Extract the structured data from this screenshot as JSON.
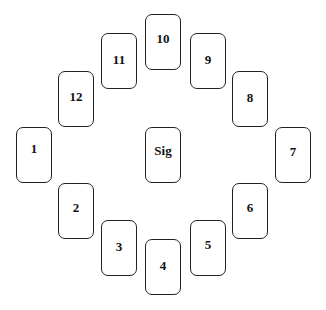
{
  "cards": [
    {
      "id": "1",
      "label": "1",
      "x": 16,
      "y": 127,
      "ty": 21
    },
    {
      "id": "2",
      "label": "2",
      "x": 58,
      "y": 183,
      "ty": 24
    },
    {
      "id": "3",
      "label": "3",
      "x": 101,
      "y": 220,
      "ty": 26
    },
    {
      "id": "4",
      "label": "4",
      "x": 145,
      "y": 239,
      "ty": 26
    },
    {
      "id": "5",
      "label": "5",
      "x": 190,
      "y": 220,
      "ty": 24
    },
    {
      "id": "6",
      "label": "6",
      "x": 232,
      "y": 183,
      "ty": 24
    },
    {
      "id": "7",
      "label": "7",
      "x": 275,
      "y": 127,
      "ty": 24
    },
    {
      "id": "8",
      "label": "8",
      "x": 232,
      "y": 71,
      "ty": 26
    },
    {
      "id": "9",
      "label": "9",
      "x": 190,
      "y": 33,
      "ty": 26
    },
    {
      "id": "10",
      "label": "10",
      "x": 145,
      "y": 14,
      "ty": 24
    },
    {
      "id": "11",
      "label": "11",
      "x": 101,
      "y": 33,
      "ty": 26
    },
    {
      "id": "12",
      "label": "12",
      "x": 58,
      "y": 71,
      "ty": 25
    },
    {
      "id": "sig",
      "label": "Sig",
      "x": 145,
      "y": 127,
      "ty": 23
    }
  ]
}
